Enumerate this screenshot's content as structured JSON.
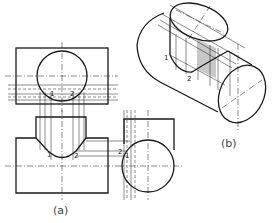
{
  "figure": {
    "views": {
      "a": {
        "caption": "(a)",
        "point_labels": [
          "1",
          "2"
        ]
      },
      "b": {
        "caption": "(b)",
        "point_labels": [
          "1",
          "2"
        ]
      }
    },
    "top_view": {
      "labels": {
        "p1": "1",
        "p2": "2"
      }
    },
    "front_view": {
      "labels": {
        "p1": "1",
        "p2": "2"
      }
    },
    "side_view": {
      "labels": {
        "p1": "1",
        "p2": "2"
      }
    },
    "iso_view": {
      "labels": {
        "p1": "1",
        "p2": "2"
      }
    }
  },
  "colors": {
    "line": "#1a1a1a",
    "thin": "#444444",
    "shade": "#c8c8c8",
    "background": "#ffffff"
  }
}
